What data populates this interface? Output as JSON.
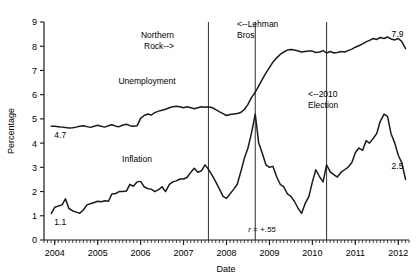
{
  "chart_data": {
    "type": "line",
    "title": "",
    "xlabel": "Date",
    "ylabel": "Percentage",
    "ylim": [
      0,
      9
    ],
    "yticks": [
      0,
      1,
      2,
      3,
      4,
      5,
      6,
      7,
      8,
      9
    ],
    "xlim": [
      2003.75,
      2012.25
    ],
    "xticks": [
      2004,
      2005,
      2006,
      2007,
      2008,
      2009,
      2010,
      2011,
      2012
    ],
    "xtick_labels": [
      "2004",
      "2005",
      "2006",
      "2007",
      "2008",
      "2009",
      "2010",
      "2011",
      "2012"
    ],
    "minor_ticks": "monthly",
    "grid": false,
    "legend": "inline-labels",
    "line_color": "#1a1a1a",
    "annotation_line_color": "#404040",
    "series": [
      {
        "name": "Unemployment",
        "label_position": {
          "x": 147,
          "y": 84
        },
        "start_value_label": "4.7",
        "end_value_label": "7.9",
        "x": [
          2003.92,
          2004.0,
          2004.08,
          2004.17,
          2004.25,
          2004.33,
          2004.42,
          2004.5,
          2004.58,
          2004.67,
          2004.75,
          2004.83,
          2004.92,
          2005.0,
          2005.08,
          2005.17,
          2005.25,
          2005.33,
          2005.42,
          2005.5,
          2005.58,
          2005.67,
          2005.75,
          2005.83,
          2005.92,
          2006.0,
          2006.08,
          2006.17,
          2006.25,
          2006.33,
          2006.42,
          2006.5,
          2006.58,
          2006.67,
          2006.75,
          2006.83,
          2006.92,
          2007.0,
          2007.08,
          2007.17,
          2007.25,
          2007.33,
          2007.42,
          2007.5,
          2007.58,
          2007.67,
          2007.75,
          2007.83,
          2007.92,
          2008.0,
          2008.08,
          2008.17,
          2008.25,
          2008.33,
          2008.42,
          2008.5,
          2008.58,
          2008.67,
          2008.75,
          2008.83,
          2008.92,
          2009.0,
          2009.08,
          2009.17,
          2009.25,
          2009.33,
          2009.42,
          2009.5,
          2009.58,
          2009.67,
          2009.75,
          2009.83,
          2009.92,
          2010.0,
          2010.08,
          2010.17,
          2010.25,
          2010.33,
          2010.42,
          2010.5,
          2010.58,
          2010.67,
          2010.75,
          2010.83,
          2010.92,
          2011.0,
          2011.08,
          2011.17,
          2011.25,
          2011.33,
          2011.42,
          2011.5,
          2011.58,
          2011.67,
          2011.75,
          2011.83,
          2011.92,
          2012.0,
          2012.08,
          2012.17
        ],
        "y": [
          4.7,
          4.7,
          4.68,
          4.66,
          4.64,
          4.62,
          4.63,
          4.66,
          4.7,
          4.72,
          4.68,
          4.65,
          4.7,
          4.74,
          4.7,
          4.66,
          4.72,
          4.76,
          4.7,
          4.68,
          4.74,
          4.78,
          4.72,
          4.7,
          4.72,
          5.02,
          5.14,
          5.2,
          5.16,
          5.26,
          5.32,
          5.36,
          5.4,
          5.46,
          5.5,
          5.52,
          5.5,
          5.46,
          5.5,
          5.46,
          5.42,
          5.46,
          5.5,
          5.48,
          5.5,
          5.46,
          5.38,
          5.3,
          5.22,
          5.14,
          5.18,
          5.2,
          5.22,
          5.26,
          5.4,
          5.6,
          5.88,
          6.1,
          6.36,
          6.62,
          6.9,
          7.12,
          7.34,
          7.52,
          7.66,
          7.76,
          7.84,
          7.86,
          7.84,
          7.8,
          7.76,
          7.78,
          7.8,
          7.8,
          7.74,
          7.76,
          7.82,
          7.72,
          7.78,
          7.72,
          7.74,
          7.78,
          7.76,
          7.82,
          7.88,
          7.96,
          8.02,
          8.1,
          8.18,
          8.24,
          8.32,
          8.28,
          8.36,
          8.32,
          8.38,
          8.3,
          8.26,
          8.32,
          8.2,
          7.9
        ]
      },
      {
        "name": "Inflation",
        "label_position": {
          "x": 137,
          "y": 162
        },
        "start_value_label": "1.1",
        "end_value_label": "2.5",
        "x": [
          2003.92,
          2004.0,
          2004.08,
          2004.17,
          2004.25,
          2004.33,
          2004.42,
          2004.5,
          2004.58,
          2004.67,
          2004.75,
          2004.83,
          2004.92,
          2005.0,
          2005.08,
          2005.17,
          2005.25,
          2005.33,
          2005.42,
          2005.5,
          2005.58,
          2005.67,
          2005.75,
          2005.83,
          2005.92,
          2006.0,
          2006.08,
          2006.17,
          2006.25,
          2006.33,
          2006.42,
          2006.5,
          2006.58,
          2006.67,
          2006.75,
          2006.83,
          2006.92,
          2007.0,
          2007.08,
          2007.17,
          2007.25,
          2007.33,
          2007.42,
          2007.5,
          2007.58,
          2007.67,
          2007.75,
          2007.83,
          2007.92,
          2008.0,
          2008.08,
          2008.17,
          2008.25,
          2008.33,
          2008.42,
          2008.5,
          2008.58,
          2008.67,
          2008.75,
          2008.83,
          2008.92,
          2009.0,
          2009.08,
          2009.17,
          2009.25,
          2009.33,
          2009.42,
          2009.5,
          2009.58,
          2009.67,
          2009.75,
          2009.83,
          2009.92,
          2010.0,
          2010.08,
          2010.17,
          2010.25,
          2010.33,
          2010.42,
          2010.5,
          2010.58,
          2010.67,
          2010.75,
          2010.83,
          2010.92,
          2011.0,
          2011.08,
          2011.17,
          2011.25,
          2011.33,
          2011.42,
          2011.5,
          2011.58,
          2011.67,
          2011.75,
          2011.83,
          2011.92,
          2012.0,
          2012.08,
          2012.17
        ],
        "y": [
          1.1,
          1.35,
          1.4,
          1.45,
          1.7,
          1.3,
          1.2,
          1.15,
          1.1,
          1.25,
          1.45,
          1.5,
          1.55,
          1.6,
          1.58,
          1.62,
          1.6,
          1.9,
          1.92,
          2.0,
          2.0,
          2.02,
          2.3,
          2.22,
          2.4,
          2.42,
          2.2,
          2.12,
          2.1,
          2.0,
          2.08,
          2.2,
          2.0,
          2.3,
          2.4,
          2.44,
          2.52,
          2.52,
          2.58,
          2.8,
          2.96,
          2.8,
          2.86,
          3.1,
          2.92,
          2.66,
          2.4,
          2.12,
          1.8,
          1.72,
          1.9,
          2.1,
          2.3,
          2.8,
          3.4,
          3.8,
          4.4,
          5.2,
          4.0,
          3.6,
          3.1,
          3.0,
          3.04,
          2.6,
          2.3,
          2.2,
          1.9,
          1.8,
          1.6,
          1.3,
          1.1,
          1.5,
          1.8,
          2.4,
          2.9,
          2.6,
          2.4,
          3.1,
          2.8,
          2.7,
          2.6,
          2.8,
          2.9,
          3.0,
          3.2,
          3.6,
          3.8,
          3.7,
          4.1,
          4.0,
          4.2,
          4.4,
          4.9,
          5.2,
          5.1,
          4.4,
          4.0,
          3.5,
          3.2,
          2.5
        ]
      }
    ],
    "event_lines": [
      {
        "id": "northern-rock",
        "x": 2007.58,
        "label_lines": [
          "Northern",
          "Rock-->"
        ],
        "label_x": 174,
        "label_y": 38,
        "label_anchor": "end"
      },
      {
        "id": "lehman-bros",
        "x": 2008.67,
        "label_lines": [
          "<--Lehman",
          "Bros"
        ],
        "label_x": 237,
        "label_y": 27,
        "label_anchor": "start"
      },
      {
        "id": "election-2010",
        "x": 2010.33,
        "label_lines": [
          "<--2010",
          "Election"
        ],
        "label_x": 308,
        "label_y": 97,
        "label_anchor": "start"
      }
    ],
    "annotations": [
      {
        "id": "correlation",
        "text": "r = +.55",
        "x": 262,
        "y": 232
      }
    ]
  }
}
